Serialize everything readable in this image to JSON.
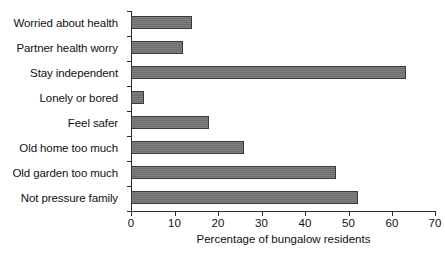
{
  "chart_data": {
    "type": "bar",
    "orientation": "horizontal",
    "title": "",
    "xlabel": "Percentage of bungalow residents",
    "ylabel": "",
    "categories": [
      "Worried about health",
      "Partner health worry",
      "Stay independent",
      "Lonely or bored",
      "Feel safer",
      "Old home too much",
      "Old garden too much",
      "Not pressure family"
    ],
    "values": [
      14,
      12,
      63,
      3,
      18,
      26,
      47,
      52
    ],
    "xlim": [
      0,
      70
    ],
    "xticks": [
      0,
      10,
      20,
      30,
      40,
      50,
      60,
      70
    ],
    "xticklabels": [
      "0",
      "10",
      "20",
      "30",
      "40",
      "50",
      "60",
      "70"
    ],
    "grid": false,
    "legend": false,
    "bar_color": "#6f6f6f",
    "bar_edge_color": "#3a3a3a",
    "axis_color": "#2b2b2b",
    "background": "#ffffff"
  }
}
